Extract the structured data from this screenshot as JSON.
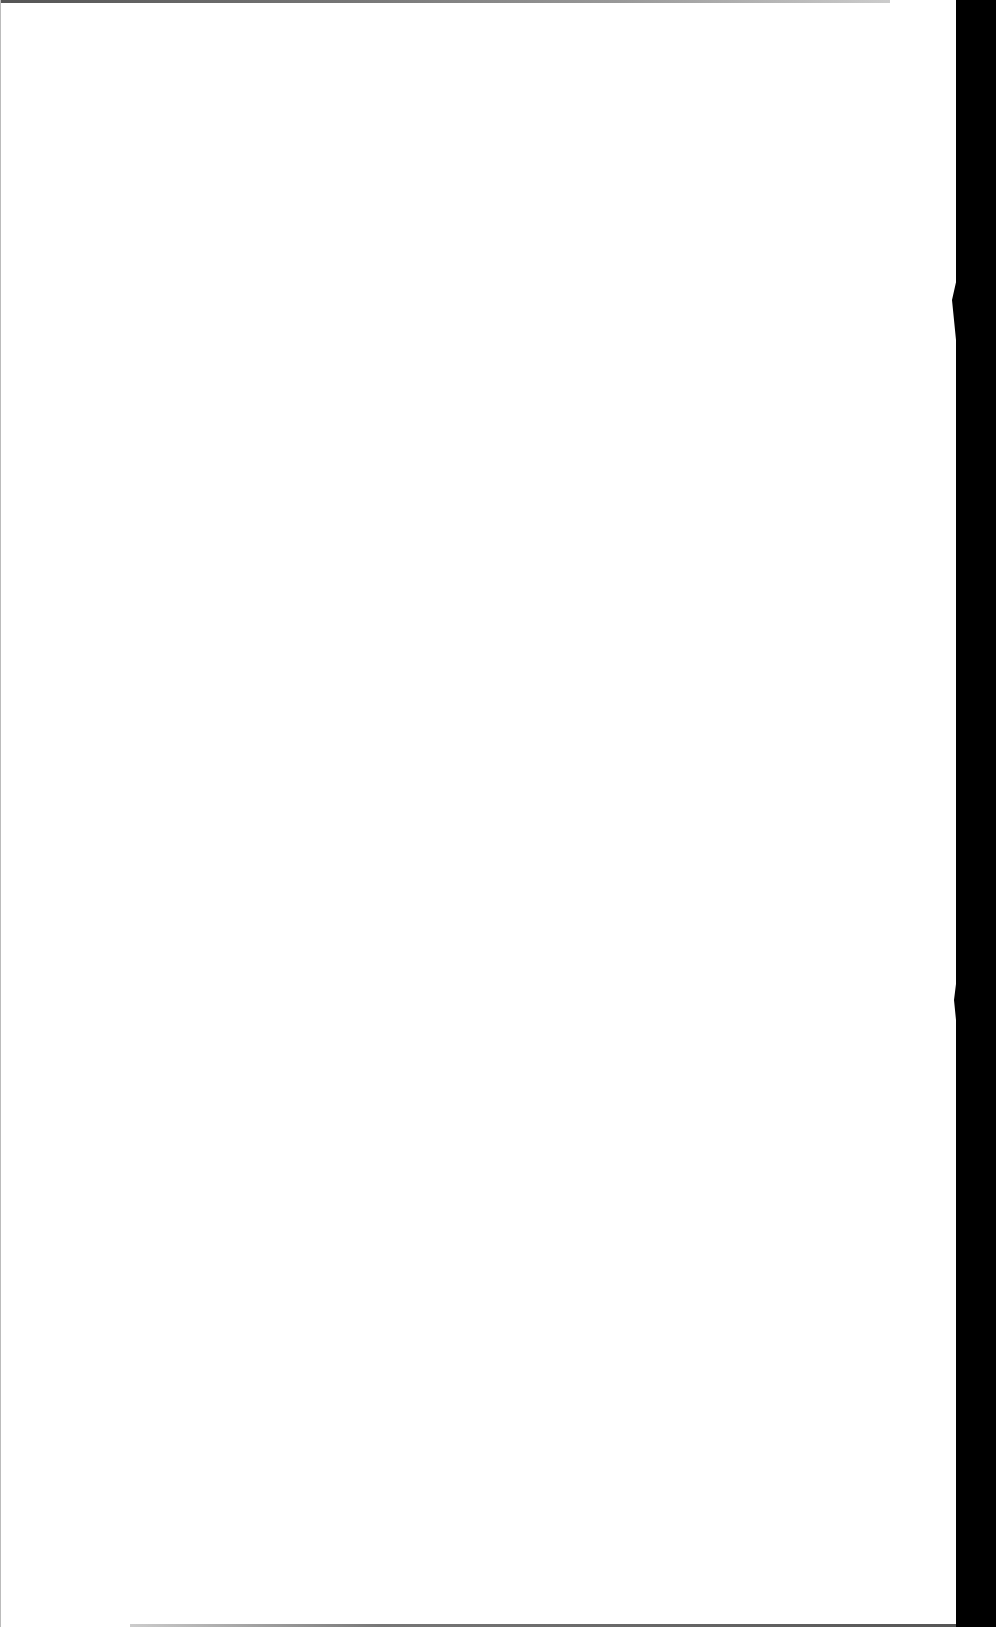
{
  "document": {
    "type": "scanned-page",
    "content_text": "",
    "background_color": "#ffffff",
    "edge_color": "#000000"
  }
}
